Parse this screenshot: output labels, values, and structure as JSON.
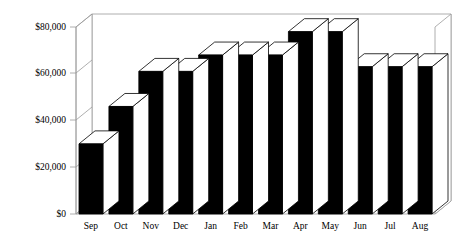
{
  "chart_data": {
    "type": "bar",
    "title": "",
    "subtitle": "",
    "xlabel": "",
    "ylabel": "",
    "categories": [
      "Sep",
      "Oct",
      "Nov",
      "Dec",
      "Jan",
      "Feb",
      "Mar",
      "Apr",
      "May",
      "Jun",
      "Jul",
      "Aug"
    ],
    "values": [
      30000,
      46000,
      61000,
      61000,
      68000,
      68000,
      68000,
      78000,
      78000,
      63000,
      63000,
      63000
    ],
    "series": [
      {
        "name": "Monthly Sales",
        "values": [
          30000,
          46000,
          61000,
          61000,
          68000,
          68000,
          68000,
          78000,
          78000,
          63000,
          63000,
          63000
        ]
      }
    ],
    "ylim": [
      0,
      80000
    ],
    "ytick_values": [
      0,
      20000,
      40000,
      60000,
      80000
    ],
    "ytick_labels": [
      "$0",
      "$20,000",
      "$40,000",
      "$60,000",
      "$80,000"
    ],
    "grid": false,
    "legend": false,
    "legend_position": "none",
    "style": "3d-bar",
    "bar_color": "#000000",
    "bar_top_color": "#ffffff",
    "bar_side_color": "#ffffff",
    "frame_color": "#808080",
    "background_color": "#ffffff",
    "annotations": []
  }
}
